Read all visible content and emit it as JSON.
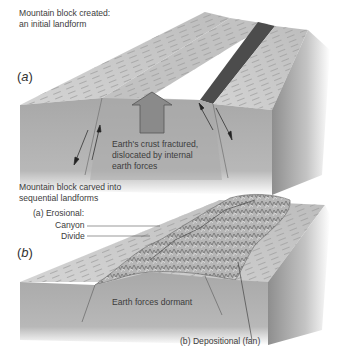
{
  "panel_a": {
    "caption_line1": "Mountain block created:",
    "caption_line2": "an initial landform",
    "label_open": "(",
    "label_letter": "a",
    "label_close": ")",
    "annotation_line1": "Earth's crust fractured,",
    "annotation_line2": "dislocated by internal",
    "annotation_line3": "earth forces"
  },
  "panel_b": {
    "caption_line1": "Mountain block carved into",
    "caption_line2": "sequential landforms",
    "label_open": "(",
    "label_letter": "b",
    "label_close": ")",
    "erosional_heading": "(a) Erosional:",
    "erosional_items": [
      "Canyon",
      "Divide"
    ],
    "center_label": "Earth forces dormant",
    "depositional_label": "(b) Depositional (fan)"
  },
  "colors": {
    "top_surface": "#c9c9c9",
    "side_face": "#a6a6a6",
    "raised_block": "#9a9a9a",
    "scarp": "#4a4a4a",
    "arrow_fill": "#8a8a8a"
  }
}
